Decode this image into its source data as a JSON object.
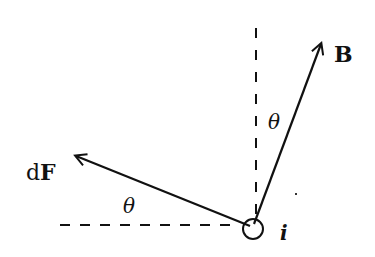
{
  "diagram": {
    "title": "",
    "colors": {
      "ink": "#111111",
      "background": "#ffffff"
    },
    "vectors": [
      {
        "id": "B",
        "label": "B",
        "from": [
          253,
          226
        ],
        "to": [
          322,
          42
        ]
      },
      {
        "id": "dF",
        "label_prefix": "d",
        "label_main": "F",
        "from": [
          250,
          226
        ],
        "to": [
          74,
          155
        ]
      }
    ],
    "reference_lines": [
      {
        "id": "vertical",
        "style": "dashed",
        "from": [
          256,
          28
        ],
        "to": [
          256,
          218
        ]
      },
      {
        "id": "horizontal",
        "style": "dashed",
        "from": [
          60,
          225
        ],
        "to": [
          240,
          225
        ]
      }
    ],
    "angles": [
      {
        "label": "θ",
        "between": [
          "vertical",
          "B"
        ]
      },
      {
        "label": "θ",
        "between": [
          "horizontal",
          "dF"
        ]
      }
    ],
    "current": {
      "label": "i",
      "symbol": "circle-out-of-page",
      "center": [
        253,
        228
      ],
      "radius": 10
    },
    "labels": {
      "B": "B",
      "dF_d": "d",
      "dF_F": "F",
      "theta_top": "θ",
      "theta_bottom": "θ",
      "current": "i"
    }
  }
}
